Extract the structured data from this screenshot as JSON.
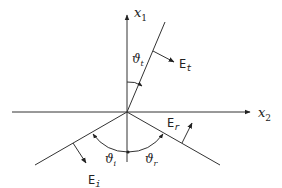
{
  "diagram": {
    "title": "",
    "type": "Reflection and refraction at an interface",
    "axes": {
      "vertical": {
        "label": "x",
        "subscript": "1"
      },
      "horizontal": {
        "label": "x",
        "subscript": "2"
      }
    },
    "rays": [
      {
        "id": "incident",
        "field_label": "E",
        "field_subscript": "i",
        "angle_label": "ϑ",
        "angle_subscript": "i"
      },
      {
        "id": "reflected",
        "field_label": "E",
        "field_subscript": "r",
        "angle_label": "ϑ",
        "angle_subscript": "r"
      },
      {
        "id": "transmitted",
        "field_label": "E",
        "field_subscript": "t",
        "angle_label": "ϑ",
        "angle_subscript": "t"
      }
    ],
    "colors": {
      "line": "#333333",
      "background": "#ffffff"
    }
  }
}
